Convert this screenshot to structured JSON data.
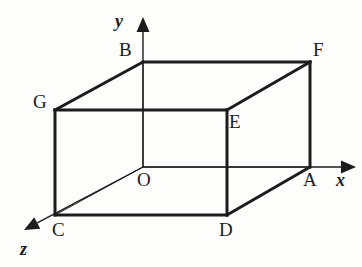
{
  "figure": {
    "type": "geometry-diagram",
    "background_color": "#fdfdfc",
    "stroke_color": "#1c1c1c",
    "bold_stroke_width": 3,
    "thin_stroke_width": 1
  },
  "axes": [
    {
      "name": "y",
      "label": "y",
      "direction": "up",
      "origin": [
        143,
        167
      ],
      "tip": [
        143,
        17
      ],
      "x": 115,
      "y": 12
    },
    {
      "name": "x",
      "label": "x",
      "direction": "right",
      "origin": [
        143,
        167
      ],
      "tip": [
        356,
        167
      ],
      "x": 336,
      "y": 171
    },
    {
      "name": "z",
      "label": "z",
      "direction": "down-left",
      "origin": [
        143,
        167
      ],
      "tip": [
        24,
        230
      ],
      "x": 20,
      "y": 240
    }
  ],
  "vertices": [
    {
      "name": "O",
      "label": "O",
      "px": 143,
      "py": 167,
      "lx": 137,
      "ly": 170
    },
    {
      "name": "A",
      "label": "A",
      "px": 310,
      "py": 167,
      "lx": 303,
      "ly": 170
    },
    {
      "name": "B",
      "label": "B",
      "px": 143,
      "py": 62,
      "lx": 119,
      "ly": 40
    },
    {
      "name": "C",
      "label": "C",
      "px": 55,
      "py": 215,
      "lx": 52,
      "ly": 220
    },
    {
      "name": "D",
      "label": "D",
      "px": 227,
      "py": 215,
      "lx": 219,
      "ly": 220
    },
    {
      "name": "E",
      "label": "E",
      "px": 227,
      "py": 110,
      "lx": 229,
      "ly": 112
    },
    {
      "name": "F",
      "label": "F",
      "px": 310,
      "py": 62,
      "lx": 313,
      "ly": 40
    },
    {
      "name": "G",
      "label": "G",
      "px": 55,
      "py": 110,
      "lx": 33,
      "ly": 92
    }
  ],
  "edges_bold": [
    {
      "name": "edge-G-B",
      "from": [
        55,
        110
      ],
      "to": [
        143,
        62
      ]
    },
    {
      "name": "edge-B-F",
      "from": [
        143,
        62
      ],
      "to": [
        310,
        62
      ]
    },
    {
      "name": "edge-E-F",
      "from": [
        227,
        110
      ],
      "to": [
        310,
        62
      ]
    },
    {
      "name": "edge-F-A",
      "from": [
        310,
        62
      ],
      "to": [
        310,
        167
      ]
    },
    {
      "name": "edge-G-E",
      "from": [
        55,
        110
      ],
      "to": [
        227,
        110
      ]
    },
    {
      "name": "edge-G-C",
      "from": [
        55,
        110
      ],
      "to": [
        55,
        215
      ]
    },
    {
      "name": "edge-E-D",
      "from": [
        227,
        110
      ],
      "to": [
        227,
        215
      ]
    },
    {
      "name": "edge-C-D",
      "from": [
        55,
        215
      ],
      "to": [
        227,
        215
      ]
    },
    {
      "name": "edge-D-A",
      "from": [
        227,
        215
      ],
      "to": [
        310,
        167
      ]
    }
  ],
  "edges_thin": [
    {
      "name": "edge-O-B-hidden",
      "from": [
        143,
        167
      ],
      "to": [
        143,
        62
      ]
    },
    {
      "name": "edge-O-A-hidden",
      "from": [
        143,
        167
      ],
      "to": [
        310,
        167
      ]
    },
    {
      "name": "edge-O-C-hidden",
      "from": [
        143,
        167
      ],
      "to": [
        55,
        215
      ]
    }
  ]
}
